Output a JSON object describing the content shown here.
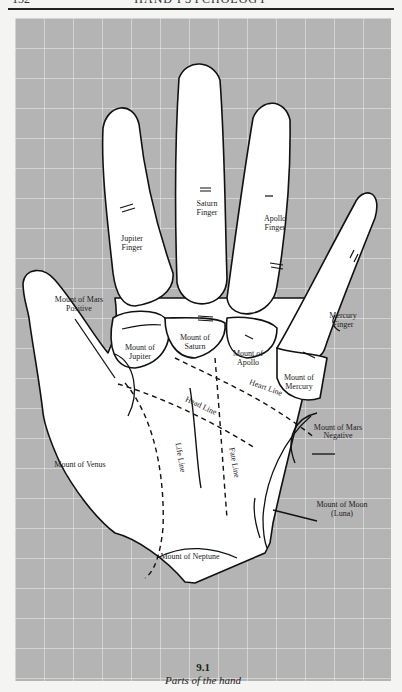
{
  "page_header": {
    "page_number": "152",
    "running_title": "HAND PSYCHOLOGY"
  },
  "figure": {
    "number": "9.1",
    "caption": "Parts of the hand",
    "colors": {
      "grid_background": "#b4b4b4",
      "grid_lines": "#f2f2f2",
      "hand_fill": "#ffffff",
      "outline": "#111111"
    },
    "labels": {
      "jupiter_finger": [
        "Jupiter",
        "Finger"
      ],
      "saturn_finger": [
        "Saturn",
        "Finger"
      ],
      "apollo_finger": [
        "Apollo",
        "Finger"
      ],
      "mercury_finger": [
        "Mercury",
        "Finger"
      ],
      "mount_mars_positive": [
        "Mount of Mars",
        "Positive"
      ],
      "mount_jupiter": [
        "Mount of",
        "Jupiter"
      ],
      "mount_saturn": [
        "Mount of",
        "Saturn"
      ],
      "mount_apollo": [
        "Mount of",
        "Apollo"
      ],
      "mount_mercury": [
        "Mount of",
        "Mercury"
      ],
      "heart_line": "Heart Line",
      "head_line": "Head Line",
      "life_line": "Life Line",
      "fate_line": "Fate Line",
      "mount_venus": "Mount of Venus",
      "mount_mars_negative": [
        "Mount of Mars",
        "Negative"
      ],
      "mount_moon": [
        "Mount of Moon",
        "(Luna)"
      ],
      "mount_neptune": "Mount of Neptune"
    }
  }
}
